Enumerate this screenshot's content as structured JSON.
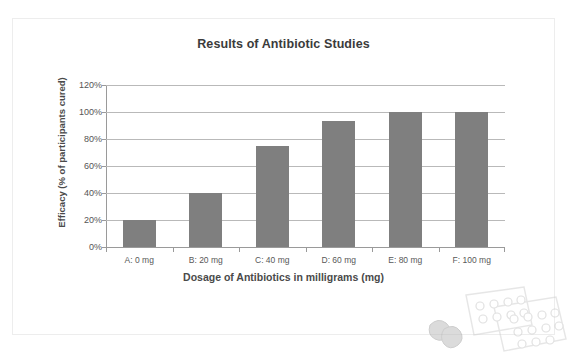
{
  "top_clipped_text": "",
  "decor": {
    "name": "pill-blister-packs-illustration"
  },
  "chart_data": {
    "type": "bar",
    "title": "Results of Antibiotic Studies",
    "xlabel": "Dosage of Antibiotics in milligrams (mg)",
    "ylabel": "Efficacy (% of participants cured)",
    "categories": [
      "A: 0 mg",
      "B: 20 mg",
      "C: 40 mg",
      "D: 60 mg",
      "E: 80 mg",
      "F: 100 mg"
    ],
    "values": [
      20,
      40,
      75,
      93,
      100,
      100
    ],
    "value_labels": [
      "20%",
      "40%",
      "75%",
      "93%",
      "100%",
      "100%"
    ],
    "ylim": [
      0,
      120
    ],
    "ytick_labels": [
      "0%",
      "20%",
      "40%",
      "60%",
      "80%",
      "100%",
      "120%"
    ],
    "ytick_values": [
      0,
      20,
      40,
      60,
      80,
      100,
      120
    ],
    "grid": true,
    "legend": false,
    "legend_position": "none",
    "series": [
      {
        "name": "Efficacy",
        "color": "#7f7f7f",
        "values": [
          20,
          40,
          75,
          93,
          100,
          100
        ]
      }
    ]
  },
  "colors": {
    "bar": "#7f7f7f",
    "gridline": "#b9b9b9",
    "axis": "#9a9a9a",
    "title_text": "#3b3b3b",
    "label_text": "#555555",
    "frame_border": "#ededed"
  }
}
